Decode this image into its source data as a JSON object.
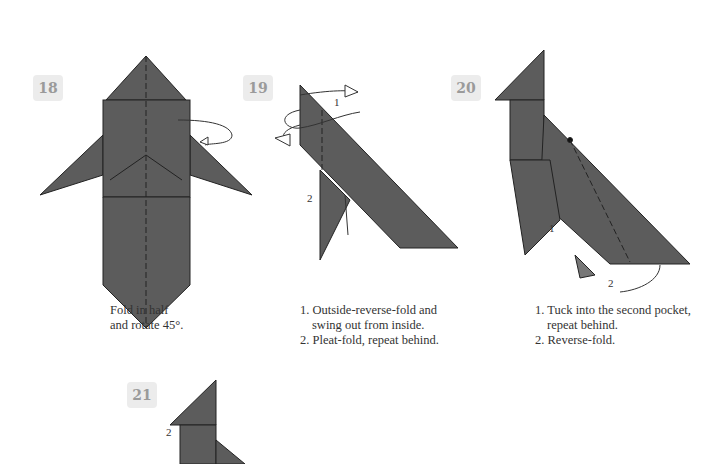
{
  "steps": [
    {
      "number": "18",
      "caption": [
        "Fold in half",
        "and rotate 45°."
      ]
    },
    {
      "number": "19",
      "caption": [
        "1. Outside-reverse-fold and swing out from inside.",
        "2. Pleat-fold, repeat behind."
      ],
      "labels": [
        "1",
        "2"
      ]
    },
    {
      "number": "20",
      "caption": [
        "1. Tuck into the second pocket, repeat behind.",
        "2. Reverse-fold."
      ],
      "labels": [
        "1",
        "2"
      ]
    },
    {
      "number": "21",
      "labels": [
        "1",
        "2"
      ]
    }
  ],
  "colors": {
    "paper": "#5c5c5c",
    "badge_bg": "#ececec",
    "badge_text": "#9a9a9a"
  }
}
